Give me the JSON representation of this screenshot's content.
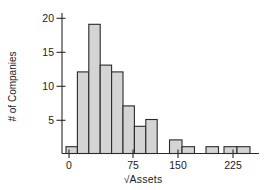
{
  "chart_data": {
    "type": "bar",
    "subtype": "histogram",
    "title": "",
    "xlabel": "√Assets",
    "ylabel": "# of Companies",
    "x_tick_labels": [
      "0",
      "75",
      "150",
      "225"
    ],
    "y_tick_labels": [
      "5",
      "10",
      "15",
      "20"
    ],
    "ylim": [
      0,
      20
    ],
    "xlim_est": [
      -10,
      240
    ],
    "grid": "off",
    "legend": "none",
    "counts": [
      1,
      12,
      19,
      13,
      12,
      7,
      4,
      5,
      0,
      2,
      1,
      0,
      1,
      0,
      1,
      1
    ],
    "bin_width_est": 15,
    "bin_centers_est": [
      0,
      15,
      30,
      45,
      60,
      75,
      90,
      105,
      120,
      135,
      150,
      165,
      180,
      195,
      210,
      225
    ],
    "colors": {
      "bar_fill": "#d4d4d4",
      "bar_stroke": "#2a2a2a",
      "axis": "#2a2a2a",
      "text": "#1b1b1b",
      "background": "#ffffff"
    },
    "render": {
      "baseline_y": 153.5,
      "unit_px": 6.8,
      "axis": {
        "x0": 62,
        "x1": 259,
        "y_top": 13
      },
      "bars": [
        {
          "x": 66.0,
          "w": 11.4,
          "count": 1
        },
        {
          "x": 77.4,
          "w": 11.4,
          "count": 12
        },
        {
          "x": 88.8,
          "w": 11.4,
          "count": 19
        },
        {
          "x": 100.2,
          "w": 11.4,
          "count": 13
        },
        {
          "x": 111.6,
          "w": 11.4,
          "count": 12
        },
        {
          "x": 123.0,
          "w": 11.4,
          "count": 7
        },
        {
          "x": 134.4,
          "w": 11.4,
          "count": 4
        },
        {
          "x": 145.8,
          "w": 11.4,
          "count": 5
        },
        {
          "x": 169.5,
          "w": 12.5,
          "count": 2
        },
        {
          "x": 182.0,
          "w": 12.5,
          "count": 1
        },
        {
          "x": 206.0,
          "w": 12.5,
          "count": 1
        },
        {
          "x": 224.0,
          "w": 13.0,
          "count": 1
        },
        {
          "x": 237.0,
          "w": 13.0,
          "count": 1
        }
      ],
      "x_ticks": [
        {
          "label": "0",
          "x": 69
        },
        {
          "label": "75",
          "x": 133
        },
        {
          "label": "150",
          "x": 178
        },
        {
          "label": "225",
          "x": 233
        }
      ],
      "y_ticks": [
        {
          "label": "5",
          "y": 120.3
        },
        {
          "label": "10",
          "y": 86.3
        },
        {
          "label": "15",
          "y": 52.3
        },
        {
          "label": "20",
          "y": 18.3
        }
      ]
    }
  }
}
